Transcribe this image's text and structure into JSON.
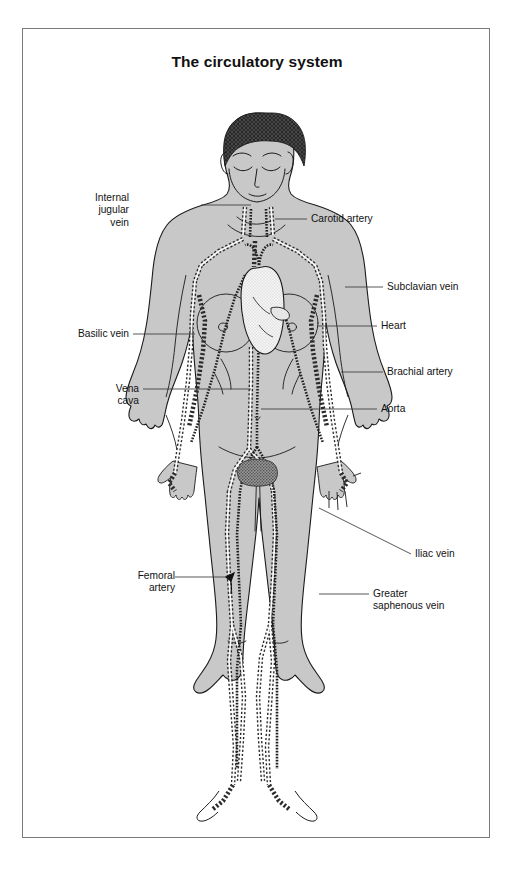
{
  "page": {
    "title": "The circulatory system",
    "background_color": "#ffffff",
    "frame_color": "#7a7a7a"
  },
  "figure": {
    "body_fill": "#c8c8c8",
    "outline_color": "#1a1a1a",
    "vessel_fill": "#ffffff",
    "hair_color": "#3a3a3a",
    "organ_heart_fill": "#f2f2f2"
  },
  "labels": [
    {
      "id": "internal-jugular-vein",
      "text": "Internal\njugular\nvein",
      "side": "left",
      "x": 105,
      "y": 163,
      "leader": {
        "x1": 178,
        "y1": 176,
        "x2": 228,
        "y2": 176
      }
    },
    {
      "id": "carotid-artery",
      "text": "Carotid artery",
      "side": "right",
      "x": 288,
      "y": 184,
      "leader": {
        "x1": 252,
        "y1": 190,
        "x2": 284,
        "y2": 190
      }
    },
    {
      "id": "basilic-vein",
      "text": "Basilic vein",
      "side": "left",
      "x": 44,
      "y": 299,
      "leader": {
        "x1": 110,
        "y1": 305,
        "x2": 172,
        "y2": 305
      }
    },
    {
      "id": "subclavian-vein",
      "text": "Subclavian vein",
      "side": "right",
      "x": 364,
      "y": 252,
      "leader": {
        "x1": 322,
        "y1": 258,
        "x2": 360,
        "y2": 258
      }
    },
    {
      "id": "heart",
      "text": "Heart",
      "side": "right",
      "x": 358,
      "y": 291,
      "leader": {
        "x1": 294,
        "y1": 297,
        "x2": 354,
        "y2": 297
      }
    },
    {
      "id": "brachial-artery",
      "text": "Brachial artery",
      "side": "right",
      "x": 364,
      "y": 337,
      "leader": {
        "x1": 318,
        "y1": 343,
        "x2": 360,
        "y2": 343
      }
    },
    {
      "id": "vena-cava",
      "text": "Vena\ncava",
      "side": "left",
      "x": 89,
      "y": 354,
      "leader": {
        "x1": 120,
        "y1": 360,
        "x2": 228,
        "y2": 360
      }
    },
    {
      "id": "aorta",
      "text": "Aorta",
      "side": "right",
      "x": 358,
      "y": 374,
      "leader": {
        "x1": 238,
        "y1": 380,
        "x2": 354,
        "y2": 380
      }
    },
    {
      "id": "iliac-vein",
      "text": "Iliac vein",
      "side": "right",
      "x": 392,
      "y": 519,
      "leader": {
        "x1": 296,
        "y1": 479,
        "x2": 388,
        "y2": 525
      }
    },
    {
      "id": "femoral-artery",
      "text": "Femoral\nartery",
      "side": "left",
      "x": 104,
      "y": 541,
      "leader": {
        "x1": 152,
        "y1": 548,
        "x2": 203,
        "y2": 548
      }
    },
    {
      "id": "greater-saphenous-vein",
      "text": "Greater\nsaphenous vein",
      "side": "right",
      "x": 350,
      "y": 559,
      "leader": {
        "x1": 296,
        "y1": 565,
        "x2": 346,
        "y2": 565
      }
    }
  ]
}
